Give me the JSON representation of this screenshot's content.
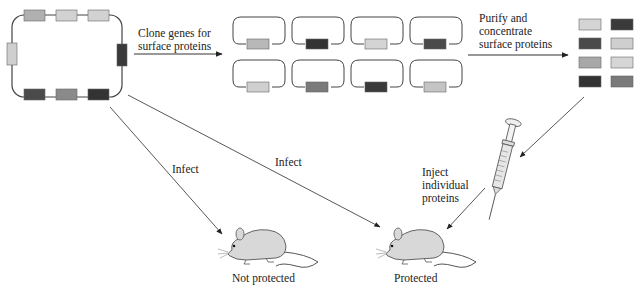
{
  "labels": {
    "clone": "Clone genes for\nsurface proteins",
    "purify": "Purify and\nconcentrate\nsurface proteins",
    "infect_left": "Infect",
    "infect_middle": "Infect",
    "inject": "Inject\nindividual\nproteins",
    "not_protected": "Not protected",
    "protected": "Protected"
  },
  "colors": {
    "line": "#444444",
    "light": "#cfcfcf",
    "lightmid": "#b0b0b0",
    "mid": "#8a8a8a",
    "dark": "#4a4a4a",
    "darker": "#333333",
    "mouse_body": "#d8d8d8"
  },
  "pathogen": {
    "genes_top": [
      "#b0b0b0",
      "#d2d2d2",
      "#d2d2d2"
    ],
    "gene_left": "#cfcfcf",
    "gene_right": "#3a3a3a",
    "genes_bottom": [
      "#4a4a4a",
      "#8a8a8a",
      "#333333"
    ]
  },
  "plasmids": {
    "row1": [
      "#b8b8b8",
      "#333333",
      "#d4d4d4",
      "#4a4a4a"
    ],
    "row2": [
      "#cfcfcf",
      "#7a7a7a",
      "#3a3a3a",
      "#c4c4c4"
    ]
  },
  "proteins": {
    "rows": [
      [
        "#d4d4d4",
        "#3a3a3a"
      ],
      [
        "#4a4a4a",
        "#cfcfcf"
      ],
      [
        "#a8a8a8",
        "#d6d6d6"
      ],
      [
        "#333333",
        "#7a7a7a"
      ]
    ]
  }
}
